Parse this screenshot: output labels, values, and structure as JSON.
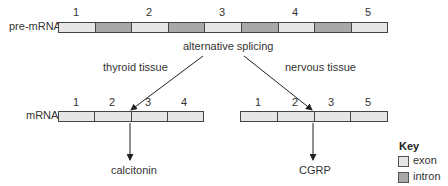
{
  "pre_mrna": {
    "label": "pre-mRNA",
    "segments": [
      "exon",
      "intron",
      "exon",
      "intron",
      "exon",
      "intron",
      "exon",
      "intron",
      "exon"
    ],
    "exon_numbers": [
      "1",
      "2",
      "3",
      "4",
      "5"
    ]
  },
  "process_label": "alternative splicing",
  "branches": {
    "left": {
      "tissue": "thyroid tissue",
      "mrna_label": "mRNA",
      "exon_numbers": [
        "1",
        "2",
        "3",
        "4"
      ],
      "product": "calcitonin"
    },
    "right": {
      "tissue": "nervous tissue",
      "exon_numbers": [
        "1",
        "2",
        "3",
        "5"
      ],
      "product": "CGRP"
    }
  },
  "key": {
    "title": "Key",
    "items": [
      {
        "type": "exon",
        "label": "exon",
        "color": "#e6e6e6"
      },
      {
        "type": "intron",
        "label": "intron",
        "color": "#a8a8a8"
      }
    ]
  },
  "colors": {
    "exon": "#e6e6e6",
    "intron": "#a8a8a8",
    "outline": "#444444"
  }
}
